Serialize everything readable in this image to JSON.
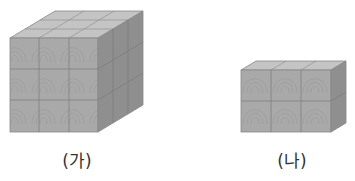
{
  "figures": [
    {
      "id": "ga",
      "label": "(가)",
      "description": "cube made of 3×3×3 wooden unit cubes",
      "cubes": {
        "width": 3,
        "height": 3,
        "depth": 3
      }
    },
    {
      "id": "na",
      "label": "(나)",
      "description": "box made of 3×2×1 wooden unit cubes",
      "cubes": {
        "width": 3,
        "height": 2,
        "depth": 1
      }
    }
  ],
  "colors": {
    "front": "#a9a9a9",
    "top": "#c4c4c4",
    "side": "#8f8f8f",
    "grid": "#7a7a7a",
    "grain": "#999999"
  }
}
